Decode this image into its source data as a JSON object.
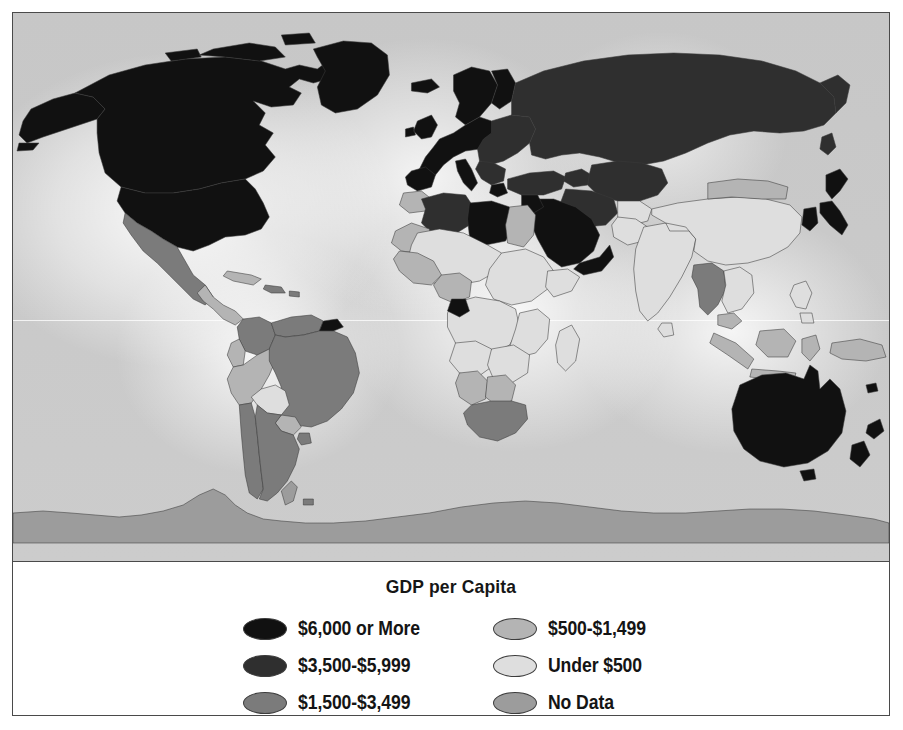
{
  "figure": {
    "type": "choropleth-world-map",
    "legend_title": "GDP per Capita"
  },
  "legend": {
    "title": "GDP per Capita",
    "columns": [
      {
        "items": [
          {
            "label": "$6,000 or More",
            "color": "#111111",
            "key": "tier-6000-plus"
          },
          {
            "label": "$3,500-$5,999",
            "color": "#2f2f2f",
            "key": "tier-3500-5999"
          },
          {
            "label": "$1,500-$3,499",
            "color": "#7b7b7b",
            "key": "tier-1500-3499"
          }
        ]
      },
      {
        "items": [
          {
            "label": "$500-$1,499",
            "color": "#b4b4b4",
            "key": "tier-500-1499"
          },
          {
            "label": "Under $500",
            "color": "#dedede",
            "key": "tier-under-500"
          },
          {
            "label": "No Data",
            "color": "#9c9c9c",
            "key": "tier-no-data"
          }
        ]
      }
    ]
  },
  "map": {
    "ocean_color": "#c9c9c9",
    "border_color": "#3a3a3a",
    "frame_color": "#4a4a4a",
    "regions": [
      {
        "name": "Canada",
        "tier": "tier-6000-plus",
        "color": "#111111"
      },
      {
        "name": "United States",
        "tier": "tier-6000-plus",
        "color": "#111111"
      },
      {
        "name": "Alaska",
        "tier": "tier-6000-plus",
        "color": "#111111"
      },
      {
        "name": "Greenland",
        "tier": "tier-6000-plus",
        "color": "#111111"
      },
      {
        "name": "Mexico",
        "tier": "tier-1500-3499",
        "color": "#7b7b7b"
      },
      {
        "name": "Central America",
        "tier": "tier-500-1499",
        "color": "#b4b4b4"
      },
      {
        "name": "Cuba",
        "tier": "tier-500-1499",
        "color": "#b4b4b4"
      },
      {
        "name": "Caribbean",
        "tier": "tier-1500-3499",
        "color": "#7b7b7b"
      },
      {
        "name": "Colombia",
        "tier": "tier-1500-3499",
        "color": "#7b7b7b"
      },
      {
        "name": "Venezuela",
        "tier": "tier-1500-3499",
        "color": "#7b7b7b"
      },
      {
        "name": "Guyanas",
        "tier": "tier-6000-plus",
        "color": "#111111"
      },
      {
        "name": "Ecuador",
        "tier": "tier-500-1499",
        "color": "#b4b4b4"
      },
      {
        "name": "Peru",
        "tier": "tier-500-1499",
        "color": "#b4b4b4"
      },
      {
        "name": "Bolivia",
        "tier": "tier-under-500",
        "color": "#dedede"
      },
      {
        "name": "Brazil",
        "tier": "tier-1500-3499",
        "color": "#7b7b7b"
      },
      {
        "name": "Paraguay",
        "tier": "tier-500-1499",
        "color": "#b4b4b4"
      },
      {
        "name": "Chile",
        "tier": "tier-1500-3499",
        "color": "#7b7b7b"
      },
      {
        "name": "Argentina",
        "tier": "tier-1500-3499",
        "color": "#7b7b7b"
      },
      {
        "name": "Uruguay",
        "tier": "tier-1500-3499",
        "color": "#7b7b7b"
      },
      {
        "name": "Western Europe",
        "tier": "tier-6000-plus",
        "color": "#111111"
      },
      {
        "name": "Scandinavia",
        "tier": "tier-6000-plus",
        "color": "#111111"
      },
      {
        "name": "United Kingdom",
        "tier": "tier-6000-plus",
        "color": "#111111"
      },
      {
        "name": "Iceland",
        "tier": "tier-6000-plus",
        "color": "#111111"
      },
      {
        "name": "Italy",
        "tier": "tier-6000-plus",
        "color": "#111111"
      },
      {
        "name": "Spain",
        "tier": "tier-6000-plus",
        "color": "#111111"
      },
      {
        "name": "Eastern Europe",
        "tier": "tier-3500-5999",
        "color": "#2f2f2f"
      },
      {
        "name": "Russia",
        "tier": "tier-3500-5999",
        "color": "#2f2f2f"
      },
      {
        "name": "Turkey",
        "tier": "tier-3500-5999",
        "color": "#2f2f2f"
      },
      {
        "name": "Central Asia",
        "tier": "tier-3500-5999",
        "color": "#2f2f2f"
      },
      {
        "name": "Morocco",
        "tier": "tier-500-1499",
        "color": "#b4b4b4"
      },
      {
        "name": "Algeria",
        "tier": "tier-3500-5999",
        "color": "#2f2f2f"
      },
      {
        "name": "Libya",
        "tier": "tier-6000-plus",
        "color": "#111111"
      },
      {
        "name": "Egypt",
        "tier": "tier-500-1499",
        "color": "#b4b4b4"
      },
      {
        "name": "Saudi Arabia",
        "tier": "tier-6000-plus",
        "color": "#111111"
      },
      {
        "name": "Gulf States",
        "tier": "tier-6000-plus",
        "color": "#111111"
      },
      {
        "name": "Sub-Saharan Africa",
        "tier": "tier-under-500",
        "color": "#dedede"
      },
      {
        "name": "West Africa",
        "tier": "tier-500-1499",
        "color": "#b4b4b4"
      },
      {
        "name": "Gabon",
        "tier": "tier-6000-plus",
        "color": "#111111"
      },
      {
        "name": "Namibia",
        "tier": "tier-500-1499",
        "color": "#b4b4b4"
      },
      {
        "name": "Botswana",
        "tier": "tier-500-1499",
        "color": "#b4b4b4"
      },
      {
        "name": "South Africa",
        "tier": "tier-1500-3499",
        "color": "#7b7b7b"
      },
      {
        "name": "Madagascar",
        "tier": "tier-under-500",
        "color": "#dedede"
      },
      {
        "name": "India",
        "tier": "tier-under-500",
        "color": "#dedede"
      },
      {
        "name": "China",
        "tier": "tier-under-500",
        "color": "#dedede"
      },
      {
        "name": "Mongolia",
        "tier": "tier-500-1499",
        "color": "#b4b4b4"
      },
      {
        "name": "Japan",
        "tier": "tier-6000-plus",
        "color": "#111111"
      },
      {
        "name": "South Korea",
        "tier": "tier-6000-plus",
        "color": "#111111"
      },
      {
        "name": "Southeast Asia",
        "tier": "tier-under-500",
        "color": "#dedede"
      },
      {
        "name": "Thailand",
        "tier": "tier-1500-3499",
        "color": "#7b7b7b"
      },
      {
        "name": "Indonesia",
        "tier": "tier-500-1499",
        "color": "#b4b4b4"
      },
      {
        "name": "Philippines",
        "tier": "tier-under-500",
        "color": "#dedede"
      },
      {
        "name": "Papua New Guinea",
        "tier": "tier-500-1499",
        "color": "#b4b4b4"
      },
      {
        "name": "Australia",
        "tier": "tier-6000-plus",
        "color": "#111111"
      },
      {
        "name": "New Zealand",
        "tier": "tier-6000-plus",
        "color": "#111111"
      },
      {
        "name": "Antarctica",
        "tier": "tier-no-data",
        "color": "#9c9c9c"
      }
    ]
  }
}
